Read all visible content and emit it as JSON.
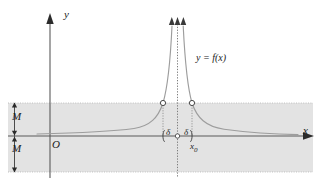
{
  "figure": {
    "name": "limit-unbounded-function-diagram",
    "axes": {
      "y_axis_label": "y",
      "x_axis_label": "x",
      "origin_label": "O"
    },
    "curve": {
      "function_label": "y = f(x)",
      "description": "unbounded function with vertical asymptote at x0"
    },
    "annotations": {
      "bound_upper_label": "M",
      "bound_lower_label": "M",
      "delta_left_label": "δ",
      "delta_right_label": "δ",
      "center_point_label": "x₀",
      "center_point_base": "x",
      "center_point_sub": "0"
    },
    "colors": {
      "band_fill": "#e2e2e2",
      "axis": "#555555",
      "curve": "#9a9a9a",
      "guide": "#8a8a8a",
      "text": "#1a1a1a",
      "background": "#ffffff"
    },
    "geometry": {
      "x_axis_y": 136,
      "y_axis_x": 50,
      "asymptote_x": 177.5,
      "band_top_y": 103,
      "band_bottom_y": 172,
      "circle_left_x": 163,
      "circle_right_x": 192,
      "circle_y": 103
    }
  }
}
